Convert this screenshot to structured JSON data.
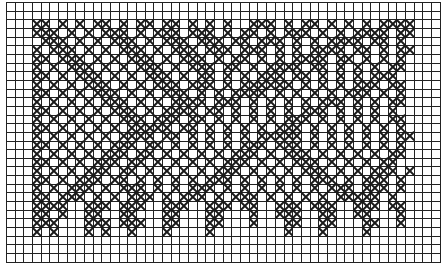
{
  "chart_title": "",
  "grid": {
    "columns": 50,
    "rows": 30,
    "stitch_symbol": "cross-stitch-x",
    "stitch_color": "#1a1a1a",
    "grid_line_color": "#222222",
    "background_color": "#ffffff"
  },
  "pattern_rows": [
    "..................................................",
    "..................................................",
    "...XX.X.X.XX.X.XX.XX.X.X.X..XXX.X.XX.X.X.X.XXXX...",
    "...XXX.X.X.XXX.X.XXX.XXX.X.XX.X.XXX.X.X.XXXX.XX...",
    "....XXX.X.X.XXX.X.XXX.XXX.XX.XXX.X.X.XXXX.XX.X....",
    "...X.XXX.X.X.XXX.X.XXX.XXX.XXX.X.X.XXXX.XX.X.XX...",
    "...XX.XXX.X.X.XXX.X.XXX.X.XX.X.X.XXXX.XX.X.X.X....",
    "...X.X.XXX.X.X.XXX.X.XXX.XX.X.XXXX.XX.X.X.X.XX....",
    "...XX.X.XXX.X.X.XXX.X.XX.X.X.XXX.XX.X.X.X.XXX.....",
    "...X.X.X.XXX.X.X.XXX.XXX.X.XXXXXX.X.X.X.XXX.XX....",
    "...XX.X.X.XXX.X.X.XXX.X.X.XXXX.X.X.X.X.XXX.X.X....",
    "...X.X.X.X.XXX.X.X.XXXX.XXX.X.X.X.X.XXX.X.X.XX....",
    "...XX.X.X.X.XXX.X.XXXX.XX.X.X.X.X.XXX.X.X.X.X.....",
    "...X.X.X.X.X.XXX.XXX.XX.X.X.X.X.XXX.X.X.X.X.XX....",
    "...XX.X.X.X.X.XXXXX.XX.X.X.X.X.XXX.X.X.X.X.X.X....",
    "...X.X.X.X.X.XXXX.XX.X.X.X.X.XXXXX.X.X.X.X.X.XX...",
    "...XX.X.X.X.XXX.XX.X.X.X.X.XXX.XXX.X.X.X.X.X.X....",
    "...X.X.X.X.XXX.XX.X.X.X.X.XXX.X.XXX.X.X.X.X.XX....",
    "...XX.X.X.XXX.XX.X.X.X.X.XXX.X.X.XXX.X.X.X.XX.....",
    "...X.X.X.XXX.XX.X.X.X.X.XXX.X.X.X.XXX.X.X.XXX.X...",
    "...XX.X.XXX.XX.X.X.X.X.XXX.X.X.X.X.XXX.X.XXX.X....",
    "...X.X.XXX.X.XXX.X.X.XXX.X.X.X.X.X.X.XXX.XXX.X....",
    "...XX.XXX.X.X.XXX.X.XXX.X.XXX.X.X.X.X.XXXXX.X.....",
    "...XXXX..XXX.XXX..XXX..XXX.XX..XXX.XXX..XXX.XX....",
    "...XX.X..XX..XX...XX...XX...X..XXX..XX..XX...X....",
    "...XXX...XXX.XXX..XX...XX...X...XX..XX...XX..X....",
    "...X.X...X.X..X...X....X........X...X....X........",
    "..................................................",
    "..................................................",
    ".................................................."
  ]
}
